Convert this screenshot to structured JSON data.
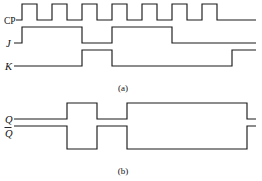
{
  "figure": {
    "stroke_color": "#1a1a1a",
    "background_color": "#ffffff",
    "panels": [
      {
        "id": "a",
        "caption": "(a)",
        "signals": [
          {
            "name": "CP",
            "label": "CP",
            "label_style": "roman",
            "type": "clock",
            "pulse_count": 7,
            "period": 30,
            "first_rise_x": 22,
            "duty_cycle": 0.5,
            "high_y": 4,
            "low_y": 20
          },
          {
            "name": "J",
            "label": "J",
            "label_style": "italic",
            "type": "level",
            "high_y": 27,
            "low_y": 43,
            "segments": [
              {
                "level": "low",
                "from": 14,
                "to": 22
              },
              {
                "level": "high",
                "from": 22,
                "to": 82
              },
              {
                "level": "low",
                "from": 82,
                "to": 112
              },
              {
                "level": "high",
                "from": 112,
                "to": 172
              },
              {
                "level": "low",
                "from": 172,
                "to": 256
              }
            ]
          },
          {
            "name": "K",
            "label": "K",
            "label_style": "italic",
            "type": "level",
            "high_y": 50,
            "low_y": 66,
            "segments": [
              {
                "level": "low",
                "from": 14,
                "to": 82
              },
              {
                "level": "high",
                "from": 82,
                "to": 112
              },
              {
                "level": "low",
                "from": 112,
                "to": 232
              },
              {
                "level": "high",
                "from": 232,
                "to": 256
              }
            ]
          }
        ]
      },
      {
        "id": "b",
        "caption": "(b)",
        "signals": [
          {
            "name": "Q",
            "label": "Q",
            "label_style": "italic",
            "overbar": false,
            "type": "level",
            "high_y": 103,
            "low_y": 119,
            "segments": [
              {
                "level": "low",
                "from": 14,
                "to": 67
              },
              {
                "level": "high",
                "from": 67,
                "to": 97
              },
              {
                "level": "low",
                "from": 97,
                "to": 127
              },
              {
                "level": "high",
                "from": 127,
                "to": 247
              },
              {
                "level": "low",
                "from": 247,
                "to": 256
              }
            ]
          },
          {
            "name": "Qbar",
            "label": "Q",
            "label_style": "italic",
            "overbar": true,
            "type": "level",
            "high_y": 126,
            "low_y": 149,
            "segments": [
              {
                "level": "high",
                "from": 14,
                "to": 67
              },
              {
                "level": "low",
                "from": 67,
                "to": 97
              },
              {
                "level": "high",
                "from": 97,
                "to": 127
              },
              {
                "level": "low",
                "from": 127,
                "to": 247
              },
              {
                "level": "high",
                "from": 247,
                "to": 256
              }
            ]
          }
        ]
      }
    ]
  },
  "chart_data": {
    "type": "line",
    "xlabel": "",
    "ylabel": "",
    "grid": false,
    "legend": "none",
    "xlim": [
      0,
      7
    ],
    "time_unit": "clock period",
    "note": "Digital timing waveforms. Values are logic levels (0/1) sampled per clock period; panel (a) shows inputs CP, J, K and panel (b) shows outputs Q and Q-bar.",
    "series": [
      {
        "name": "CP",
        "panel": "a",
        "kind": "clock",
        "description": "7 square clock pulses, 50% duty cycle",
        "transitions_logic": [
          1,
          0,
          1,
          0,
          1,
          0,
          1,
          0,
          1,
          0,
          1,
          0,
          1,
          0
        ],
        "values": [
          1,
          0,
          1,
          0,
          1,
          0,
          1,
          0,
          1,
          0,
          1,
          0,
          1,
          0
        ]
      },
      {
        "name": "J",
        "panel": "a",
        "kind": "level",
        "description": "High for clock periods 1-2, low for period 3, high for periods 4-5, low afterwards",
        "values": [
          1,
          1,
          0,
          1,
          1,
          0,
          0
        ]
      },
      {
        "name": "K",
        "panel": "a",
        "kind": "level",
        "description": "Low for periods 1-2, high for period 3, low for periods 4-6, high for period 7",
        "values": [
          0,
          0,
          1,
          0,
          0,
          0,
          1
        ]
      },
      {
        "name": "Q",
        "panel": "b",
        "kind": "level",
        "description": "Output toggles on clock edges per JK truth table",
        "values": [
          0,
          1,
          0,
          1,
          1,
          1,
          1,
          0
        ]
      },
      {
        "name": "Qbar",
        "panel": "b",
        "kind": "level",
        "description": "Complement of Q",
        "values": [
          1,
          0,
          1,
          0,
          0,
          0,
          0,
          1
        ]
      }
    ]
  }
}
